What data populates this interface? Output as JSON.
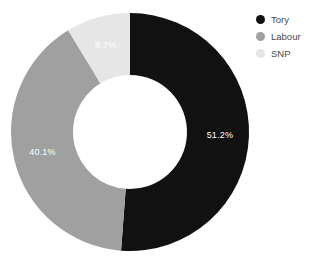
{
  "chart_data": {
    "type": "pie",
    "variant": "donut",
    "title": "",
    "subtitle": "",
    "xlabel": "",
    "ylabel": "",
    "grid": false,
    "legend_position": "right",
    "hole_ratio": 0.48,
    "start_angle_deg": 0,
    "direction": "clockwise",
    "units": "percent",
    "total": 100.0,
    "categories": [
      "Tory",
      "Labour",
      "SNP"
    ],
    "values": [
      51.2,
      40.1,
      8.7
    ],
    "colors": [
      "#111111",
      "#a0a0a0",
      "#e6e6e6"
    ],
    "data_labels": [
      "51.2%",
      "40.1%",
      "8.7%"
    ],
    "data_label_color": "#ffffff",
    "slices": [
      {
        "name": "Tory",
        "value": 51.2,
        "label": "51.2%",
        "color": "#111111",
        "start_deg": 0.0,
        "sweep_deg": 184.32
      },
      {
        "name": "Labour",
        "value": 40.1,
        "label": "40.1%",
        "color": "#a0a0a0",
        "start_deg": 184.32,
        "sweep_deg": 144.36
      },
      {
        "name": "SNP",
        "value": 8.7,
        "label": "8.7%",
        "color": "#e6e6e6",
        "start_deg": 328.68,
        "sweep_deg": 31.32
      }
    ],
    "legend": [
      {
        "label": "Tory",
        "color": "#111111"
      },
      {
        "label": "Labour",
        "color": "#a0a0a0"
      },
      {
        "label": "SNP",
        "color": "#e6e6e6"
      }
    ]
  },
  "geometry": {
    "center_x": 130,
    "center_y": 132,
    "outer_radius": 119,
    "inner_radius": 57,
    "label_radius": 90
  },
  "background_color": "#ffffff",
  "legend_text_color": "#4a4a4a"
}
